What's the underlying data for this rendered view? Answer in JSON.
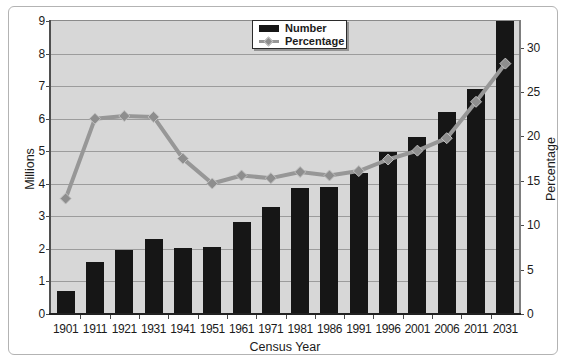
{
  "figure": {
    "left_axis": {
      "title": "Millions",
      "min": 0,
      "max": 9,
      "ticks": [
        0,
        1,
        2,
        3,
        4,
        5,
        6,
        7,
        8,
        9
      ]
    },
    "right_axis": {
      "title": "Percentage",
      "min": 0,
      "max": 33,
      "ticks": [
        0,
        5,
        10,
        15,
        20,
        25,
        30
      ]
    },
    "x_axis": {
      "title": "Census Year"
    },
    "legend": [
      {
        "label": "Number",
        "swatch": "black-bar"
      },
      {
        "label": "Percentage",
        "swatch": "gray-line-diamond"
      }
    ]
  },
  "chart_data": {
    "type": "bar+line",
    "title": "",
    "xlabel": "Census Year",
    "ylabel_left": "Millions",
    "ylabel_right": "Percentage",
    "ylim_left": [
      0,
      9
    ],
    "ylim_right": [
      0,
      33
    ],
    "grid": true,
    "legend_position": "top-center",
    "categories": [
      "1901",
      "1911",
      "1921",
      "1931",
      "1941",
      "1951",
      "1961",
      "1971",
      "1981",
      "1986",
      "1991",
      "1996",
      "2001",
      "2006",
      "2011",
      "2031"
    ],
    "series": [
      {
        "name": "Number",
        "type": "bar",
        "axis": "left",
        "unit": "millions",
        "values": [
          0.7,
          1.59,
          1.96,
          2.31,
          2.02,
          2.06,
          2.84,
          3.3,
          3.87,
          3.91,
          4.34,
          4.97,
          5.45,
          6.19,
          6.9,
          9.0
        ]
      },
      {
        "name": "Percentage",
        "type": "line",
        "axis": "right",
        "unit": "%",
        "values": [
          13.0,
          22.0,
          22.3,
          22.2,
          17.5,
          14.7,
          15.6,
          15.3,
          16.0,
          15.6,
          16.1,
          17.4,
          18.4,
          19.8,
          23.9,
          28.2
        ]
      }
    ],
    "colors": {
      "plot_background": "#d7d7d7",
      "gridline": "#9c9c9c",
      "bar": "#161616",
      "line": "#979797",
      "marker_fill": "#8e8e8e",
      "marker_stroke": "#c0c0c0",
      "text": "#1b1b1b"
    }
  }
}
